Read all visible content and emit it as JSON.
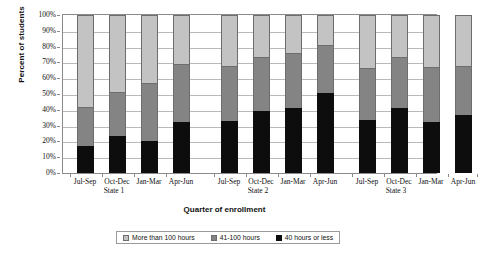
{
  "chart_data": {
    "type": "bar",
    "subtype": "100% stacked column",
    "title": "",
    "xlabel": "Quarter of enrollment",
    "ylabel": "Percent of students",
    "ylim": [
      0,
      100
    ],
    "yticks": [
      "0%",
      "10%",
      "20%",
      "30%",
      "40%",
      "50%",
      "60%",
      "70%",
      "80%",
      "90%",
      "100%"
    ],
    "ytick_values": [
      0,
      10,
      20,
      30,
      40,
      50,
      60,
      70,
      80,
      90,
      100
    ],
    "grid": true,
    "legend_position": "bottom",
    "groups": [
      "State 1",
      "State 2",
      "State 3"
    ],
    "categories": [
      "Jul-Sep",
      "Oct-Dec",
      "Jan-Mar",
      "Apr-Jun",
      "Jul-Sep",
      "Oct-Dec",
      "Jan-Mar",
      "Apr-Jun",
      "Jul-Sep",
      "Oct-Dec",
      "Jan-Mar",
      "Apr-Jun"
    ],
    "series": [
      {
        "name": "More than 100 hours",
        "color": "#c3c3c3",
        "values": [
          58.5,
          49.0,
          43.0,
          31.0,
          32.5,
          26.5,
          24.0,
          19.0,
          33.5,
          26.5,
          33.0,
          32.0
        ]
      },
      {
        "name": "41-100 hours",
        "color": "#848484",
        "values": [
          24.5,
          27.5,
          37.0,
          36.5,
          34.5,
          34.5,
          35.0,
          30.5,
          33.0,
          32.5,
          34.5,
          31.5
        ]
      },
      {
        "name": "40 hours or less",
        "color": "#0d0d0d",
        "values": [
          17.0,
          23.5,
          20.0,
          32.5,
          33.0,
          39.0,
          41.0,
          50.5,
          33.5,
          41.0,
          32.5,
          36.5
        ]
      }
    ],
    "bar_groups": [
      {
        "group": "State 1",
        "bars": [
          {
            "category": "Jul-Sep",
            "more_than_100_hours": 58.5,
            "hours_41_100": 24.5,
            "hours_40_or_less": 17.0
          },
          {
            "category": "Oct-Dec",
            "more_than_100_hours": 49.0,
            "hours_41_100": 27.5,
            "hours_40_or_less": 23.5
          },
          {
            "category": "Jan-Mar",
            "more_than_100_hours": 43.0,
            "hours_41_100": 37.0,
            "hours_40_or_less": 20.0
          },
          {
            "category": "Apr-Jun",
            "more_than_100_hours": 31.0,
            "hours_41_100": 36.5,
            "hours_40_or_less": 32.5
          }
        ]
      },
      {
        "group": "State 2",
        "bars": [
          {
            "category": "Jul-Sep",
            "more_than_100_hours": 32.5,
            "hours_41_100": 34.5,
            "hours_40_or_less": 33.0
          },
          {
            "category": "Oct-Dec",
            "more_than_100_hours": 26.5,
            "hours_41_100": 34.5,
            "hours_40_or_less": 39.0
          },
          {
            "category": "Jan-Mar",
            "more_than_100_hours": 24.0,
            "hours_41_100": 35.0,
            "hours_40_or_less": 41.0
          },
          {
            "category": "Apr-Jun",
            "more_than_100_hours": 19.0,
            "hours_41_100": 30.5,
            "hours_40_or_less": 50.5
          }
        ]
      },
      {
        "group": "State 3",
        "bars": [
          {
            "category": "Jul-Sep",
            "more_than_100_hours": 33.5,
            "hours_41_100": 33.0,
            "hours_40_or_less": 33.5
          },
          {
            "category": "Oct-Dec",
            "more_than_100_hours": 26.5,
            "hours_41_100": 32.5,
            "hours_40_or_less": 41.0
          },
          {
            "category": "Jan-Mar",
            "more_than_100_hours": 33.0,
            "hours_41_100": 34.5,
            "hours_40_or_less": 32.5
          },
          {
            "category": "Apr-Jun",
            "more_than_100_hours": 32.0,
            "hours_41_100": 31.5,
            "hours_40_or_less": 36.5
          }
        ]
      }
    ],
    "legend": [
      {
        "label": "More than 100 hours",
        "color": "#c3c3c3"
      },
      {
        "label": "41-100 hours",
        "color": "#848484"
      },
      {
        "label": "40 hours or less",
        "color": "#0d0d0d"
      }
    ]
  },
  "layout": {
    "bar_x_positions": [
      14,
      46,
      78,
      110,
      158,
      190,
      222,
      254,
      296,
      328,
      360,
      392
    ],
    "group_label_x": [
      52,
      196,
      334
    ]
  }
}
